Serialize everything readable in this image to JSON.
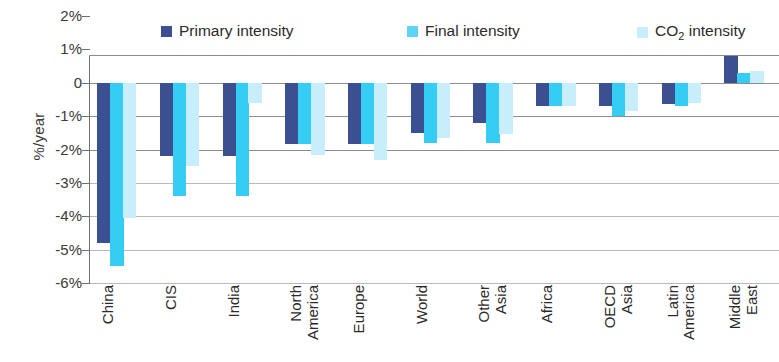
{
  "chart_data": {
    "type": "bar",
    "title": "",
    "xlabel": "",
    "ylabel": "%/year",
    "ylim": [
      -6,
      2
    ],
    "ytick_labels": [
      "2%",
      "1%",
      "0",
      "-1%",
      "-2%",
      "-3%",
      "-4%",
      "-5%",
      "-6%"
    ],
    "ytick_values": [
      2,
      1,
      0,
      -1,
      -2,
      -3,
      -4,
      -5,
      -6
    ],
    "grid": true,
    "legend_position": "top",
    "categories": [
      "China",
      "CIS",
      "India",
      "North America",
      "Europe",
      "World",
      "Other Asia",
      "Africa",
      "OECD Asia",
      "Latin America",
      "Middle East"
    ],
    "category_lines": [
      [
        "China"
      ],
      [
        "CIS"
      ],
      [
        "India"
      ],
      [
        "North",
        "America"
      ],
      [
        "Europe"
      ],
      [
        "World"
      ],
      [
        "Other",
        "Asia"
      ],
      [
        "Africa"
      ],
      [
        "OECD",
        "Asia"
      ],
      [
        "Latin",
        "America"
      ],
      [
        "Middle",
        "East"
      ]
    ],
    "series": [
      {
        "name": "Primary intensity",
        "color": "#3c4f91",
        "values": [
          -4.8,
          -2.2,
          -2.2,
          -1.85,
          -1.85,
          -1.5,
          -1.2,
          -0.7,
          -0.7,
          -0.65,
          1.05
        ]
      },
      {
        "name": "Final intensity",
        "color": "#35cdf4",
        "values": [
          -5.5,
          -3.4,
          -3.4,
          -1.85,
          -1.85,
          -1.8,
          -1.8,
          -0.7,
          -1.0,
          -0.7,
          0.3
        ]
      },
      {
        "name": "CO2 intensity",
        "color": "#c8eefc",
        "values": [
          -4.05,
          -2.5,
          -0.6,
          -2.15,
          -2.3,
          -1.65,
          -1.55,
          -0.7,
          -0.85,
          -0.6,
          0.35
        ]
      }
    ]
  },
  "legend": {
    "items": [
      {
        "label": "Primary intensity",
        "swatch": "primary"
      },
      {
        "label": "Final intensity",
        "swatch": "final"
      },
      {
        "label": "CO",
        "sub": "2",
        "label_tail": " intensity",
        "swatch": "co2"
      }
    ]
  }
}
